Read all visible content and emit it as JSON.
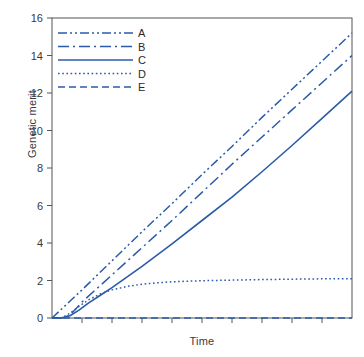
{
  "chart_data": {
    "type": "line",
    "title": "",
    "xlabel": "Time",
    "ylabel": "Genetic merit",
    "xlim": [
      0,
      10
    ],
    "ylim": [
      0,
      16
    ],
    "grid": false,
    "legend_position": "top-left-inside",
    "accent_color": "#2B5BA8",
    "frame_color": "#555555",
    "background": "#FFFFFF",
    "y_ticks": [
      0,
      2,
      4,
      6,
      8,
      10,
      12,
      14,
      16
    ],
    "y_tick_labels": [
      "0",
      "2",
      "4",
      "6",
      "8",
      "10",
      "12",
      "14",
      "16"
    ],
    "x_ticks": [
      0,
      1,
      2,
      3,
      4,
      5,
      6,
      7,
      8,
      9,
      10
    ],
    "x_tick_labels": [
      "",
      "",
      "",
      "",
      "",
      "",
      "",
      "",
      "",
      "",
      ""
    ],
    "series": [
      {
        "name": "A",
        "label": "A",
        "style": "dash-dot-dot",
        "dasharray": "9,3,2,3,2,3",
        "color": "#2B5BA8",
        "width": 1.5,
        "x": [
          0,
          0.5,
          1,
          2,
          3,
          4,
          5,
          6,
          7,
          8,
          9,
          10
        ],
        "values": [
          0.0,
          0.75,
          1.5,
          3.05,
          4.6,
          6.1,
          7.65,
          9.15,
          10.7,
          12.2,
          13.7,
          15.2
        ]
      },
      {
        "name": "B",
        "label": "B",
        "style": "dash-dot",
        "dasharray": "11,4,2,4",
        "color": "#2B5BA8",
        "width": 1.5,
        "x": [
          0,
          0.3,
          0.6,
          1,
          2,
          3,
          4,
          5,
          6,
          7,
          8,
          9,
          10
        ],
        "values": [
          0.0,
          0.0,
          0.15,
          0.85,
          2.3,
          3.75,
          5.2,
          6.7,
          8.2,
          9.65,
          11.1,
          12.55,
          14.0
        ]
      },
      {
        "name": "C",
        "label": "C",
        "style": "solid",
        "dasharray": "none",
        "color": "#2B5BA8",
        "width": 1.6,
        "x": [
          0,
          0.3,
          0.6,
          0.9,
          1.2,
          1.6,
          2,
          3,
          4,
          5,
          6,
          7,
          8,
          9,
          10
        ],
        "values": [
          0.0,
          0.0,
          0.12,
          0.42,
          0.78,
          1.2,
          1.62,
          2.75,
          3.95,
          5.2,
          6.45,
          7.8,
          9.2,
          10.65,
          12.1
        ]
      },
      {
        "name": "D",
        "label": "D",
        "style": "dotted",
        "dasharray": "1.6,2.6",
        "color": "#2B5BA8",
        "width": 1.5,
        "x": [
          0,
          0.3,
          0.6,
          0.9,
          1.2,
          1.6,
          2,
          2.5,
          3,
          3.5,
          4,
          5,
          6,
          7,
          8,
          9,
          10
        ],
        "values": [
          0.0,
          0.0,
          0.25,
          0.62,
          0.95,
          1.28,
          1.5,
          1.68,
          1.8,
          1.88,
          1.93,
          1.99,
          2.02,
          2.05,
          2.07,
          2.09,
          2.1
        ]
      },
      {
        "name": "E",
        "label": "E",
        "style": "dashed",
        "dasharray": "7,4",
        "color": "#2B5BA8",
        "width": 1.6,
        "x": [
          0,
          10
        ],
        "values": [
          0.0,
          0.0
        ]
      }
    ]
  },
  "legend": {
    "entries": [
      {
        "label": "A"
      },
      {
        "label": "B"
      },
      {
        "label": "C"
      },
      {
        "label": "D"
      },
      {
        "label": "E"
      }
    ]
  }
}
